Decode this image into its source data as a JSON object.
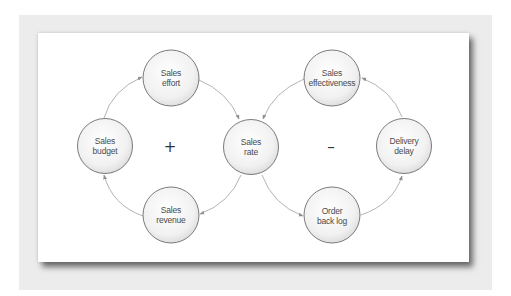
{
  "diagram": {
    "type": "causal-loop",
    "colors": {
      "node_fill_center": "#ffffff",
      "node_fill_edge": "#dcdcdc",
      "node_stroke": "#5a5a5a",
      "arrow": "#9a9a9a",
      "frame": "#ececec",
      "panel": "#ffffff",
      "text": "#4a4a4a"
    },
    "loops": [
      {
        "id": "reinforcing",
        "sign": "+",
        "x": 170,
        "y": 147
      },
      {
        "id": "balancing",
        "sign": "–",
        "x": 331,
        "y": 147
      }
    ],
    "nodes": [
      {
        "id": "sales-effort",
        "line1": "Sales",
        "line2": "effort",
        "cx": 171,
        "cy": 78
      },
      {
        "id": "sales-budget",
        "line1": "Sales",
        "line2": "budget",
        "cx": 105,
        "cy": 146
      },
      {
        "id": "sales-rate",
        "line1": "Sales",
        "line2": "rate",
        "cx": 251,
        "cy": 147
      },
      {
        "id": "sales-revenue",
        "line1": "Sales",
        "line2": "revenue",
        "cx": 171,
        "cy": 215
      },
      {
        "id": "sales-effectiveness",
        "line1": "Sales",
        "line2": "effectiveness",
        "cx": 332,
        "cy": 78
      },
      {
        "id": "delivery-delay",
        "line1": "Delivery",
        "line2": "delay",
        "cx": 404,
        "cy": 146
      },
      {
        "id": "order-back-log",
        "line1": "Order",
        "line2": "back log",
        "cx": 332,
        "cy": 215
      }
    ],
    "edges": [
      {
        "from": "sales-budget",
        "to": "sales-effort"
      },
      {
        "from": "sales-effort",
        "to": "sales-rate"
      },
      {
        "from": "sales-rate",
        "to": "sales-revenue"
      },
      {
        "from": "sales-revenue",
        "to": "sales-budget"
      },
      {
        "from": "sales-effectiveness",
        "to": "sales-rate"
      },
      {
        "from": "sales-rate",
        "to": "order-back-log"
      },
      {
        "from": "order-back-log",
        "to": "delivery-delay"
      },
      {
        "from": "delivery-delay",
        "to": "sales-effectiveness"
      }
    ]
  }
}
